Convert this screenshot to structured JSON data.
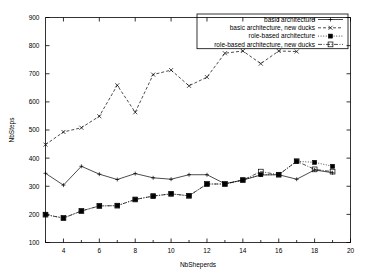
{
  "chart_data": {
    "type": "line",
    "title": "",
    "xlabel": "NbSheperds",
    "ylabel": "NbSteps",
    "xlim": [
      3,
      20
    ],
    "ylim": [
      100,
      900
    ],
    "xticks": [
      4,
      6,
      8,
      10,
      12,
      14,
      16,
      18,
      20
    ],
    "yticks": [
      100,
      200,
      300,
      400,
      500,
      600,
      700,
      800,
      900
    ],
    "grid": false,
    "legend_position": "top-right",
    "x": [
      3,
      4,
      5,
      6,
      7,
      8,
      9,
      10,
      11,
      12,
      13,
      14,
      15,
      16,
      17,
      18,
      19
    ],
    "series": [
      {
        "name": "basic architecture",
        "marker": "plus",
        "linestyle": "solid",
        "values": [
          346,
          304,
          371,
          343,
          324,
          345,
          330,
          325,
          341,
          341,
          309,
          322,
          340,
          341,
          325,
          358,
          348
        ]
      },
      {
        "name": "basic architecture, new ducks",
        "marker": "cross",
        "linestyle": "dashed",
        "values": [
          448,
          493,
          508,
          549,
          659,
          563,
          697,
          713,
          657,
          688,
          773,
          781,
          736,
          781,
          779,
          null,
          null
        ]
      },
      {
        "name": "role-based architecture",
        "marker": "filled-square",
        "linestyle": "dotted",
        "values": [
          199,
          187,
          212,
          230,
          231,
          253,
          265,
          273,
          266,
          308,
          308,
          322,
          341,
          341,
          389,
          385,
          371
        ]
      },
      {
        "name": "role-based architecture, new ducks",
        "marker": "open-square",
        "linestyle": "dash-dot",
        "values": [
          199,
          187,
          212,
          230,
          231,
          253,
          265,
          273,
          266,
          308,
          308,
          322,
          352,
          341,
          389,
          360,
          352
        ]
      }
    ]
  },
  "axes": {
    "y_tick_labels": [
      "100",
      "200",
      "300",
      "400",
      "500",
      "600",
      "700",
      "800",
      "900"
    ],
    "x_tick_labels": [
      "4",
      "6",
      "8",
      "10",
      "12",
      "14",
      "16",
      "18",
      "20"
    ],
    "x_axis_title": "NbSheperds",
    "y_axis_title": "NbSteps"
  },
  "legend": {
    "entries": [
      {
        "label": "basic architecture",
        "marker_icon": "plus-marker"
      },
      {
        "label": "basic architecture, new ducks",
        "marker_icon": "cross-marker"
      },
      {
        "label": "role-based architecture",
        "marker_icon": "filled-square-marker"
      },
      {
        "label": "role-based architecture, new ducks",
        "marker_icon": "open-square-marker"
      }
    ]
  },
  "colors": {
    "foreground": "#000000",
    "background": "#ffffff"
  }
}
